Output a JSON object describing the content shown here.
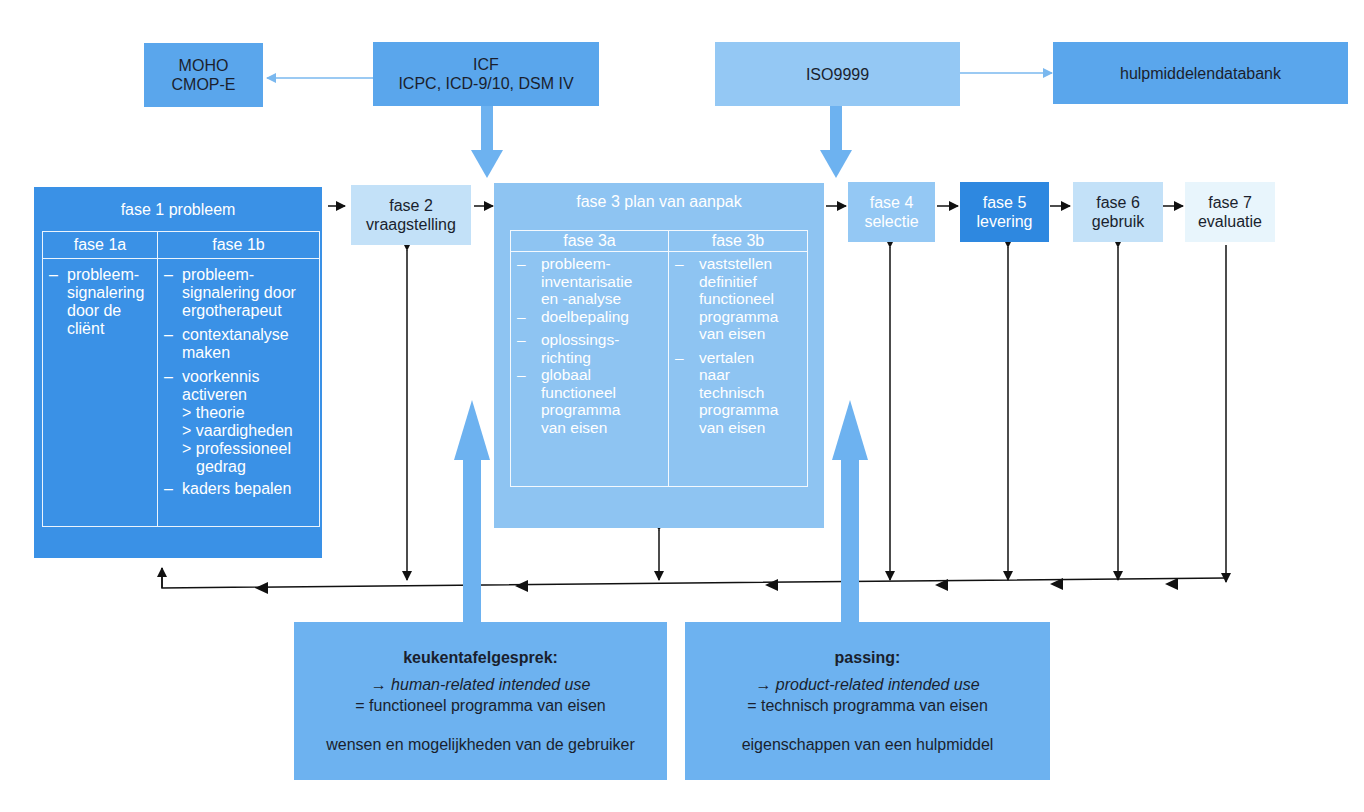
{
  "top": {
    "moho": {
      "line1": "MOHO",
      "line2": "CMOP-E"
    },
    "icf": {
      "line1": "ICF",
      "line2": "ICPC, ICD-9/10, DSM IV"
    },
    "iso": {
      "label": "ISO9999"
    },
    "database": {
      "label": "hulpmiddelendatabank"
    }
  },
  "phases": {
    "fase1": {
      "title": "fase 1 probleem",
      "sub_a": {
        "title": "fase 1a",
        "items": [
          "probleem-",
          "signalering",
          "door de",
          "cliënt"
        ]
      },
      "sub_b": {
        "title": "fase 1b",
        "items": [
          {
            "dash": "–",
            "lines": [
              "probleem-",
              "signalering door",
              "ergotherapeut"
            ]
          },
          {
            "dash": "–",
            "lines": [
              "contextanalyse",
              "maken"
            ]
          },
          {
            "dash": "–",
            "lines": [
              "voorkennis",
              "activeren",
              "> theorie",
              "> vaardigheden",
              "> professioneel",
              "  gedrag"
            ]
          },
          {
            "dash": "–",
            "lines": [
              "kaders bepalen"
            ]
          }
        ]
      }
    },
    "fase2": {
      "line1": "fase 2",
      "line2": "vraagstelling"
    },
    "fase3": {
      "title": "fase 3 plan van aanpak",
      "sub_a": {
        "title": "fase 3a",
        "items": [
          {
            "dash": "–",
            "lines": [
              "probleem-",
              "inventarisatie",
              "en -analyse"
            ]
          },
          {
            "dash": "–",
            "lines": [
              "doelbepaling"
            ]
          },
          {
            "dash": "–",
            "lines": [
              "oplossings-",
              "richting"
            ]
          },
          {
            "dash": "–",
            "lines": [
              "globaal",
              "functioneel",
              "programma",
              "van eisen"
            ]
          }
        ]
      },
      "sub_b": {
        "title": "fase 3b",
        "items": [
          {
            "dash": "–",
            "lines": [
              "vaststellen",
              "definitief",
              "functioneel",
              "programma",
              "van eisen"
            ]
          },
          {
            "dash": "–",
            "lines": [
              "vertalen",
              "naar",
              "technisch",
              "programma",
              "van eisen"
            ]
          }
        ]
      }
    },
    "fase4": {
      "line1": "fase 4",
      "line2": "selectie"
    },
    "fase5": {
      "line1": "fase 5",
      "line2": "levering"
    },
    "fase6": {
      "line1": "fase 6",
      "line2": "gebruik"
    },
    "fase7": {
      "line1": "fase 7",
      "line2": "evaluatie"
    }
  },
  "bottom": {
    "left": {
      "title": "keukentafelgesprek:",
      "line1": "→ human-related intended use",
      "line2": "= functioneel programma van eisen",
      "line3": "wensen en mogelijkheden van de gebruiker"
    },
    "right": {
      "title": "passing:",
      "line1": "→ product-related intended use",
      "line2": "= technisch programma van eisen",
      "line3": "eigenschappen van een hulpmiddel"
    }
  },
  "colors": {
    "arrow_blue": "#6db2f0",
    "line_black": "#111111",
    "fase1": "#3a91e6",
    "fase5": "#2e88e0",
    "fase7": "#e8f5fc"
  }
}
